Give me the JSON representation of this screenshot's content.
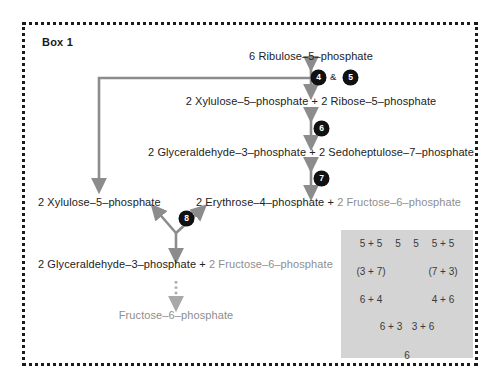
{
  "box": {
    "title": "Box 1"
  },
  "pathway": {
    "rows": [
      {
        "id": "ribulose5p",
        "text": "6 Ribulose–5–phosphate"
      },
      {
        "id": "xylulose-ribose",
        "text": "2 Xylulose–5–phosphate + 2 Ribose–5–phosphate"
      },
      {
        "id": "gap-sedo",
        "text": "2 Glyceraldehyde–3–phosphate + 2 Sedoheptulose–7–phosphate"
      },
      {
        "id": "erythrose-fruct",
        "text": "2 Erythrose–4–phosphate + ",
        "text_gray": "2 Fructose–6–phosphate"
      },
      {
        "id": "xylulose5p",
        "text": "2 Xylulose–5–phosphate"
      },
      {
        "id": "gap-fruct",
        "text": "2 Glyceraldehyde–3–phosphate + ",
        "text_gray": "2 Fructose–6–phosphate"
      },
      {
        "id": "fructose6p",
        "text": "Fructose–6–phosphate"
      }
    ],
    "steps": [
      {
        "id": "step-4",
        "label": "4"
      },
      {
        "id": "step-5",
        "label": "5"
      },
      {
        "id": "step-6",
        "label": "6"
      },
      {
        "id": "step-7",
        "label": "7"
      },
      {
        "id": "step-8",
        "label": "8"
      }
    ],
    "conjunction": "&"
  },
  "inset": {
    "top_labels": [
      "5 + 5",
      "5",
      "5",
      "5 + 5"
    ],
    "second_labels": [
      "(3 + 7)",
      "(7 + 3)"
    ],
    "third_labels": [
      "6 + 4",
      "4 + 6"
    ],
    "fourth_labels": [
      "6 + 3",
      "3 + 6"
    ],
    "final_label": "6"
  },
  "colors": {
    "ink": "#222222",
    "gray_text": "#8e8e8e",
    "arrow": "#8c8c8c",
    "badge": "#111111",
    "frame": "#1a1a1a",
    "inset_bg": "#d4d4d4",
    "inset_ink": "#3a3a3a"
  }
}
